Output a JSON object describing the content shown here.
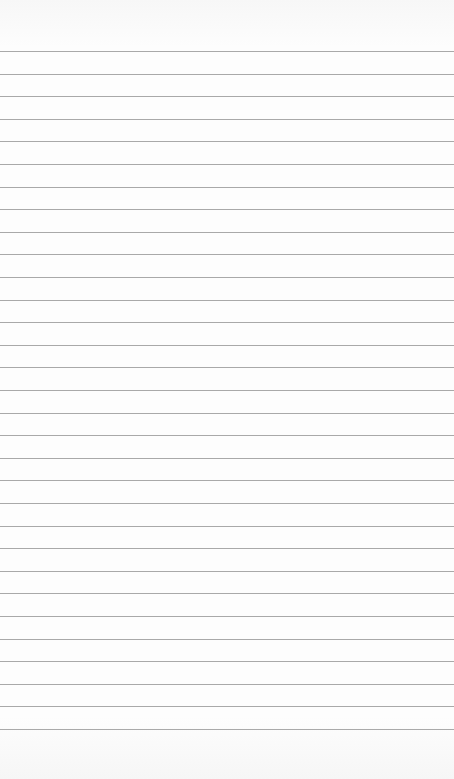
{
  "page": {
    "type": "lined-notepad",
    "background_color": "#fbfbfb",
    "rule_color": "#9a9a9a",
    "rule_count": 31,
    "first_rule_y": 51,
    "rule_spacing": 22.6
  }
}
